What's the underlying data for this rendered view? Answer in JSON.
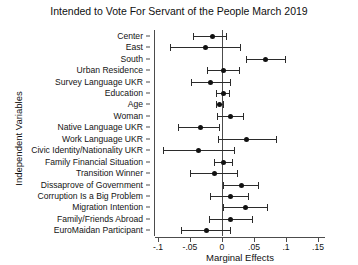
{
  "chart_data": {
    "type": "scatter",
    "title": "Intended to Vote For Servant of the People March 2019",
    "xlabel": "Marginal Effects",
    "ylabel": "Independent Variables",
    "xlim": [
      -0.115,
      0.16
    ],
    "xticks": [
      -0.1,
      -0.05,
      0,
      0.05,
      0.1,
      0.15
    ],
    "xticklabels": [
      "-.1",
      "-.05",
      "0",
      ".05",
      ".1",
      ".15"
    ],
    "grid": false,
    "legend": null,
    "zero_reference_line": 0,
    "categories": [
      "Center",
      "East",
      "South",
      "Urban Residence",
      "Survey Language UKR",
      "Education",
      "Age",
      "Woman",
      "Native Language UKR",
      "Work Language UKR",
      "Civic Identity/Nationality UKR",
      "Family Financial Situation",
      "Transition Winner",
      "Dissaprove of Government",
      "Corruption Is a Big Problem",
      "Migration Intention",
      "Family/Friends Abroad",
      "EuroMaidan Participant"
    ],
    "values": [
      -0.016,
      -0.026,
      0.067,
      0.001,
      -0.018,
      0.001,
      -0.004,
      0.013,
      -0.035,
      0.038,
      -0.037,
      0.001,
      -0.013,
      0.029,
      0.012,
      0.036,
      0.013,
      -0.025
    ],
    "ci_low": [
      -0.046,
      -0.082,
      0.038,
      -0.023,
      -0.048,
      -0.01,
      -0.009,
      -0.008,
      -0.068,
      -0.006,
      -0.092,
      -0.013,
      -0.05,
      0.001,
      -0.018,
      0.002,
      -0.021,
      -0.064
    ],
    "ci_high": [
      0.006,
      0.028,
      0.098,
      0.026,
      0.013,
      0.011,
      0.002,
      0.033,
      -0.004,
      0.085,
      0.019,
      0.015,
      0.024,
      0.056,
      0.04,
      0.071,
      0.047,
      0.013
    ],
    "marker": "filled-circle",
    "error_bar_style": "capped-horizontal"
  }
}
